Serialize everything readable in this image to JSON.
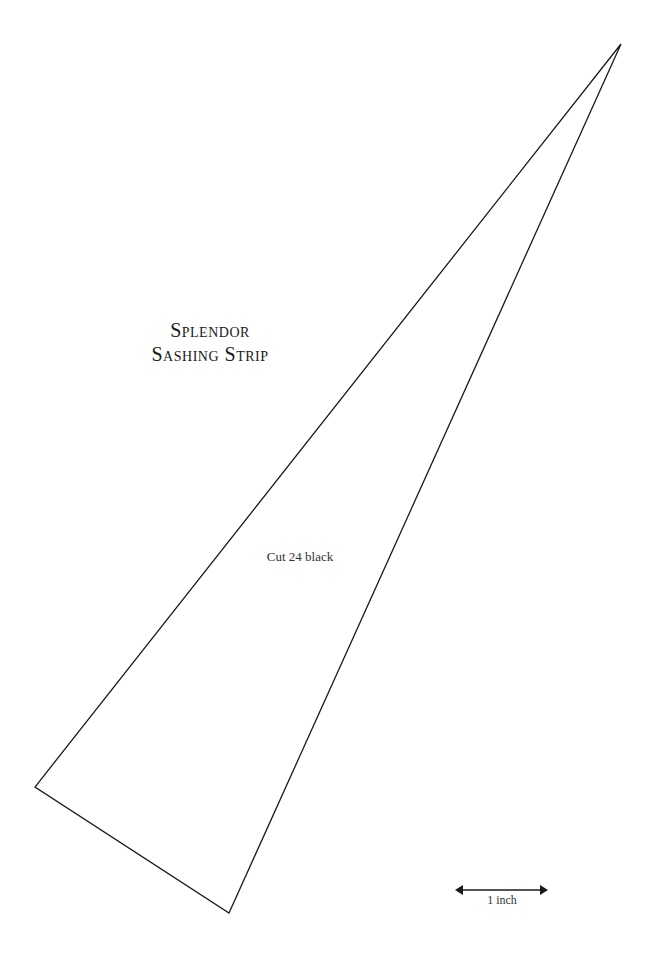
{
  "pattern": {
    "title_line1": "Splendor",
    "title_line2": "Sashing Strip",
    "instruction": "Cut 24 black",
    "shape": {
      "type": "triangle",
      "vertices": [
        [
          621,
          44
        ],
        [
          35,
          787
        ],
        [
          229,
          913
        ]
      ],
      "stroke": "#1a1a1a"
    }
  },
  "scale": {
    "label": "1 inch"
  }
}
